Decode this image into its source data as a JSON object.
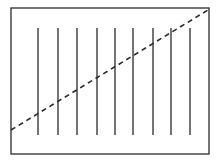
{
  "diagram": {
    "frame": {
      "x": 11,
      "y": 8,
      "width": 198,
      "height": 146
    },
    "vertical_lines": {
      "count": 9,
      "x_positions": [
        38,
        58,
        77,
        97,
        115,
        133,
        153,
        171,
        190
      ],
      "y_top": 28,
      "y_bottom": 135
    },
    "dashed_line": {
      "x1": 11,
      "y1": 130,
      "x2": 208,
      "y2": 10
    },
    "colors": {
      "stroke": "#2a2a2a",
      "background": "#ffffff"
    }
  }
}
